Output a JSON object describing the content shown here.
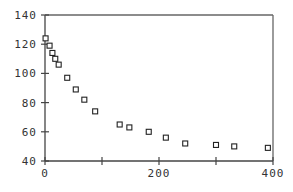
{
  "chart_data": {
    "type": "scatter",
    "title": "",
    "xlabel": "",
    "ylabel": "",
    "xlim": [
      0,
      400
    ],
    "ylim": [
      40,
      140
    ],
    "xticks": [
      0,
      100,
      200,
      300,
      400
    ],
    "xtick_labels": [
      "0",
      "",
      "200",
      "",
      "400"
    ],
    "yticks": [
      40,
      60,
      80,
      100,
      120,
      140
    ],
    "ytick_labels": [
      "40",
      "60",
      "80",
      "100",
      "120",
      "140"
    ],
    "grid": false,
    "legend": null,
    "marker": "open-square",
    "series": [
      {
        "name": "data",
        "x": [
          1,
          8,
          13,
          18,
          24,
          39,
          54,
          69,
          88,
          131,
          148,
          182,
          212,
          246,
          300,
          332,
          391
        ],
        "y": [
          124,
          119,
          114,
          110,
          106,
          97,
          89,
          82,
          74,
          65,
          63,
          60,
          56,
          52,
          51,
          50,
          49
        ]
      }
    ]
  }
}
